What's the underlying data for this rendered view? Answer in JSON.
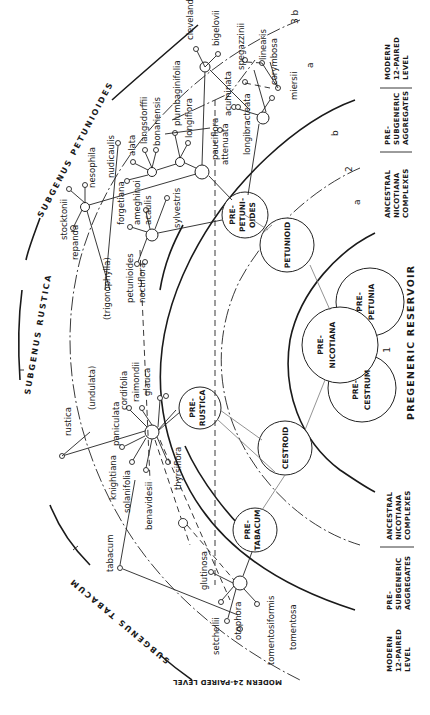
{
  "diagram": {
    "subgenera": {
      "petunioides": "SUBGENUS PETUNIOIDES",
      "rustica": "SUBGENUS RUSTICA",
      "tabacum": "SUBGENUS TABACUM"
    },
    "levels": {
      "modern24_top": "MODERN 24-PAIRED LEVEL",
      "modern12": [
        "MODERN",
        "12-PAIRED",
        "LEVEL"
      ],
      "presubgeneric": [
        "PRE-",
        "SUBGENERIC",
        "AGGREGATES"
      ],
      "ancestral": [
        "ANCESTRAL",
        "NICOTIANA",
        "COMPLEXES"
      ],
      "pregeneric": "PREGENERIC RESERVOIR",
      "modern12_bottom": [
        "MODERN",
        "12-PAIRED",
        "LEVEL"
      ],
      "presubgeneric_bottom": [
        "PRE-",
        "SUBGENERIC",
        "AGGREGATES"
      ],
      "ancestral_bottom": [
        "ANCESTRAL",
        "NICOTIANA",
        "COMPLEXES"
      ],
      "modern24_bottom": [
        "MODERN 24-PAIRED",
        "LEVEL"
      ]
    },
    "markers": {
      "one": "1",
      "two": "2",
      "three_b": "3 b",
      "a_outer": "a",
      "b_mid": "b",
      "a_inner": "a"
    },
    "core_complexes": {
      "pre_nicotiana": [
        "PRE-",
        "NICOTIANA"
      ],
      "pre_petunia": [
        "PRE-",
        "PETUNIA"
      ],
      "pre_cestrum": [
        "PRE-",
        "CESTRUM"
      ],
      "petunioid": "PETUNIOID",
      "cestroid": "CESTROID",
      "pre_petunioides": [
        "PRE-",
        "PETUNI-",
        "OIDES"
      ],
      "pre_rustica": [
        "PRE-",
        "RUSTICA"
      ],
      "pre_tabacum": [
        "PRE-",
        "TABACUM"
      ]
    },
    "species": {
      "petunioides": [
        "clevelandii",
        "bigelovii",
        "plumbaginifolia",
        "longiflora",
        "langsdorffii",
        "bonariensis",
        "alata",
        "nudicaulis",
        "nesophila",
        "stocktonii",
        "repanda",
        "forgetiana",
        "ameghinoi",
        "acaulis",
        "sylvestris",
        "petunioides",
        "noctiflora",
        "pauciflora",
        "attenuata",
        "acuminata",
        "longibracteata",
        "spegazzinii",
        "linearis",
        "corymbosa",
        "miersii",
        "(trigonophylla)"
      ],
      "rustica": [
        "rustica",
        "(undulata)",
        "paniculata",
        "cordifolia",
        "raimondii",
        "glauca",
        "knightiana",
        "solanifolia",
        "benavidesii",
        "thyrsiflora"
      ],
      "tabacum": [
        "tabacum",
        "glutinosa",
        "setchellii",
        "otophora",
        "tomentosiformis",
        "tomentosa"
      ]
    }
  }
}
